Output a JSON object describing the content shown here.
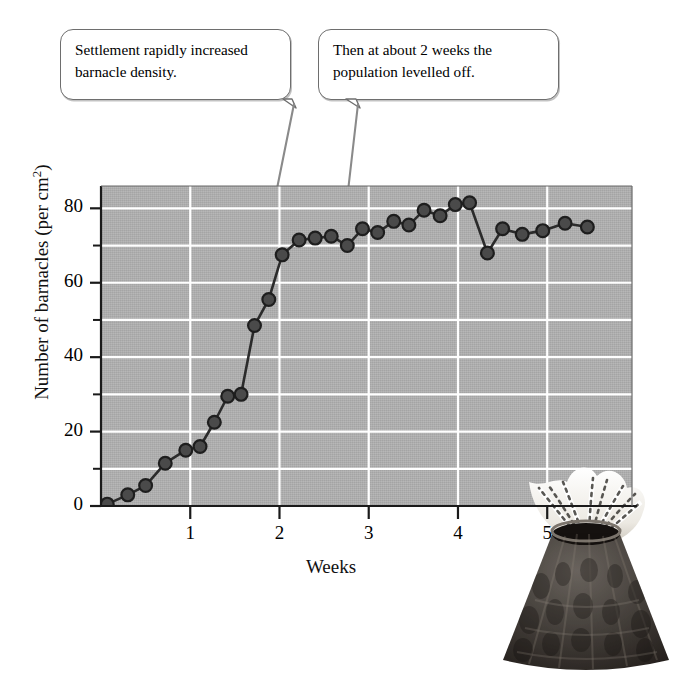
{
  "figure": {
    "background_color": "#ffffff",
    "plot_background_color": "#b2b2b2",
    "gridline_color": "#ffffff",
    "series_color": "#2b2b2b",
    "callout_border_color": "#6e6e6e"
  },
  "callouts": [
    {
      "id": "callout-settlement",
      "line1": "Settlement rapidly increased",
      "line2": "barnacle density."
    },
    {
      "id": "callout-levelled-off",
      "line1": "Then at about 2 weeks the",
      "line2": "population levelled off."
    }
  ],
  "illustration": {
    "name": "barnacle-photo",
    "description": "Photograph of a barnacle with feathery white cirri extended from a dark conical shell"
  },
  "chart_data": {
    "type": "line",
    "title": "",
    "xlabel": "Weeks",
    "ylabel": "Number of barnacles (per cm2)",
    "ylabel_html": "Number of barnacles (per cm<sup>2</sup>)",
    "xlim": [
      0,
      5.95
    ],
    "ylim": [
      0,
      86
    ],
    "xticks": [
      1,
      2,
      3,
      4,
      5
    ],
    "xtick_labels": [
      "1",
      "2",
      "3",
      "4",
      "5"
    ],
    "yticks": [
      0,
      20,
      40,
      60,
      80
    ],
    "ytick_labels": [
      "0",
      "20",
      "40",
      "60",
      "80"
    ],
    "y_minor_ticks": [
      10,
      30,
      50,
      70
    ],
    "grid": true,
    "grid_horizontal_step": 10,
    "grid_vertical_at": [
      1,
      2,
      3,
      4,
      5
    ],
    "legend": "none",
    "marker": "circle",
    "series": [
      {
        "name": "Barnacle density",
        "x": [
          0.07,
          0.3,
          0.5,
          0.72,
          0.95,
          1.11,
          1.27,
          1.42,
          1.57,
          1.72,
          1.88,
          2.03,
          2.22,
          2.4,
          2.58,
          2.76,
          2.93,
          3.1,
          3.28,
          3.45,
          3.62,
          3.8,
          3.97,
          4.13,
          4.33,
          4.5,
          4.72,
          4.95,
          5.2,
          5.45
        ],
        "y": [
          0.5,
          3.0,
          5.5,
          11.5,
          15.0,
          16.0,
          22.5,
          29.5,
          30.0,
          48.5,
          55.5,
          67.5,
          71.5,
          72.0,
          72.5,
          70.0,
          74.5,
          73.5,
          76.5,
          75.5,
          79.5,
          78.0,
          81.0,
          81.5,
          68.0,
          74.5,
          73.0,
          74.0,
          76.0,
          75.0
        ]
      }
    ],
    "annotations": [
      {
        "text": "Settlement rapidly increased barnacle density.",
        "points_to_x": 1.65,
        "points_to_y": 48
      },
      {
        "text": "Then at about 2 weeks the population levelled off.",
        "points_to_x": 2.72,
        "points_to_y": 72
      }
    ]
  }
}
